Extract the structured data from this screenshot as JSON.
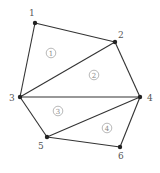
{
  "diagram": {
    "type": "triangulated-polygon-mesh",
    "colors": {
      "edge": "#333333",
      "node": "#222222",
      "label": "#555555",
      "region": "#888888"
    },
    "nodes": [
      {
        "id": "1",
        "x": 35,
        "y": 23,
        "lx": 29,
        "ly": 16
      },
      {
        "id": "2",
        "x": 115,
        "y": 42,
        "lx": 118,
        "ly": 38
      },
      {
        "id": "3",
        "x": 20,
        "y": 97,
        "lx": 9,
        "ly": 101
      },
      {
        "id": "4",
        "x": 140,
        "y": 97,
        "lx": 147,
        "ly": 101
      },
      {
        "id": "5",
        "x": 47,
        "y": 137,
        "lx": 38,
        "ly": 149
      },
      {
        "id": "6",
        "x": 120,
        "y": 147,
        "lx": 118,
        "ly": 159
      }
    ],
    "edges": [
      [
        "1",
        "2"
      ],
      [
        "1",
        "3"
      ],
      [
        "2",
        "3"
      ],
      [
        "2",
        "4"
      ],
      [
        "3",
        "4"
      ],
      [
        "3",
        "5"
      ],
      [
        "4",
        "5"
      ],
      [
        "4",
        "6"
      ],
      [
        "5",
        "6"
      ]
    ],
    "regions": [
      {
        "id": "1",
        "label": "1",
        "x": 51,
        "y": 53,
        "triangle": [
          "1",
          "2",
          "3"
        ]
      },
      {
        "id": "2",
        "label": "2",
        "x": 94,
        "y": 75,
        "triangle": [
          "2",
          "3",
          "4"
        ]
      },
      {
        "id": "3",
        "label": "3",
        "x": 58,
        "y": 111,
        "triangle": [
          "3",
          "4",
          "5"
        ]
      },
      {
        "id": "4",
        "label": "4",
        "x": 107,
        "y": 128,
        "triangle": [
          "4",
          "5",
          "6"
        ]
      }
    ]
  }
}
